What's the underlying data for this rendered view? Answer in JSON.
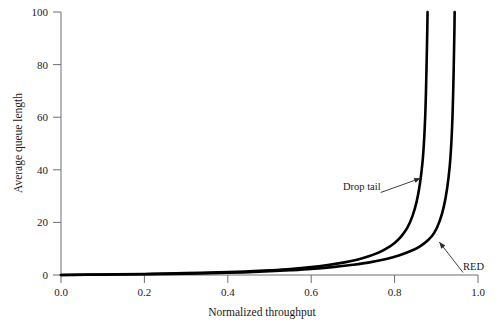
{
  "chart_data": {
    "type": "line",
    "title": "",
    "xlabel": "Normalized throughput",
    "ylabel": "Average queue length",
    "xlim": [
      0.0,
      1.0
    ],
    "ylim": [
      0,
      100
    ],
    "grid": false,
    "legend_position": "inline-annotations",
    "xticks": [
      "0.0",
      "0.2",
      "0.4",
      "0.6",
      "0.8",
      "1.0"
    ],
    "xtick_values": [
      0.0,
      0.2,
      0.4,
      0.6,
      0.8,
      1.0
    ],
    "yticks": [
      "0",
      "20",
      "40",
      "60",
      "80",
      "100"
    ],
    "ytick_values": [
      0,
      20,
      40,
      60,
      80,
      100
    ],
    "series": [
      {
        "name": "Drop tail",
        "x": [
          0.0,
          0.1,
          0.2,
          0.3,
          0.4,
          0.45,
          0.5,
          0.55,
          0.6,
          0.64,
          0.68,
          0.71,
          0.74,
          0.76,
          0.78,
          0.8,
          0.815,
          0.83,
          0.843,
          0.853,
          0.861,
          0.867,
          0.871,
          0.874,
          0.876,
          0.8775,
          0.8785,
          0.879
        ],
        "y": [
          0.0,
          0.2,
          0.4,
          0.7,
          1.1,
          1.4,
          1.8,
          2.3,
          3.0,
          3.8,
          4.8,
          5.8,
          7.2,
          8.4,
          10.0,
          12.2,
          14.5,
          17.8,
          22.5,
          28.0,
          35.0,
          43.0,
          52.0,
          63.0,
          75.0,
          86.0,
          94.0,
          100.0
        ]
      },
      {
        "name": "RED",
        "x": [
          0.0,
          0.1,
          0.2,
          0.3,
          0.4,
          0.45,
          0.5,
          0.55,
          0.6,
          0.65,
          0.7,
          0.74,
          0.78,
          0.81,
          0.84,
          0.86,
          0.88,
          0.895,
          0.908,
          0.918,
          0.926,
          0.932,
          0.936,
          0.939,
          0.941,
          0.9425,
          0.9435,
          0.944
        ],
        "y": [
          0.0,
          0.15,
          0.3,
          0.5,
          0.85,
          1.1,
          1.4,
          1.8,
          2.3,
          3.0,
          3.9,
          4.8,
          6.1,
          7.4,
          9.2,
          10.8,
          13.2,
          16.0,
          20.5,
          26.0,
          33.0,
          41.0,
          50.0,
          61.0,
          73.0,
          85.0,
          93.5,
          100.0
        ]
      }
    ],
    "annotations": [
      {
        "text": "Drop tail",
        "label_x": 0.8,
        "label_y": 27.0,
        "target_x": 0.866,
        "target_y": 37.0
      },
      {
        "text": "RED",
        "label_x": 0.99,
        "label_y": 7.0,
        "target_x": 0.905,
        "target_y": 13.0
      }
    ]
  }
}
